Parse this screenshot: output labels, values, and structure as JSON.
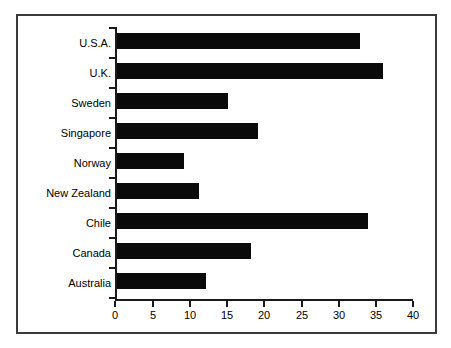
{
  "chart_data": {
    "type": "bar",
    "orientation": "horizontal",
    "title": "",
    "subtitle": "",
    "xlabel": "",
    "ylabel": "",
    "categories": [
      "Australia",
      "Canada",
      "Chile",
      "New Zealand",
      "Norway",
      "Singapore",
      "Sweden",
      "U.K.",
      "U.S.A."
    ],
    "values": [
      12,
      18,
      33.8,
      11,
      9,
      19,
      15,
      35.8,
      32.7
    ],
    "series": [
      {
        "name": "",
        "values": [
          12,
          18,
          33.8,
          11,
          9,
          19,
          15,
          35.8,
          32.7
        ]
      }
    ],
    "xlim": [
      0,
      40
    ],
    "xticks": [
      0,
      5,
      10,
      15,
      20,
      25,
      30,
      35,
      40
    ],
    "xtick_labels": [
      "0",
      "5",
      "10",
      "15",
      "20",
      "25",
      "30",
      "35",
      "40"
    ],
    "grid": false,
    "legend": false,
    "legend_position": "none",
    "bar_color": "#0a0a0a",
    "axis_color": "#1a1a1a",
    "frame_color": "#3a3a3a",
    "background": "#ffffff",
    "display_order_top_to_bottom": [
      "U.S.A.",
      "U.K.",
      "Sweden",
      "Singapore",
      "Norway",
      "New Zealand",
      "Chile",
      "Canada",
      "Australia"
    ],
    "display_values_top_to_bottom": [
      32.7,
      35.8,
      15,
      19,
      9,
      11,
      33.8,
      18,
      12
    ]
  }
}
